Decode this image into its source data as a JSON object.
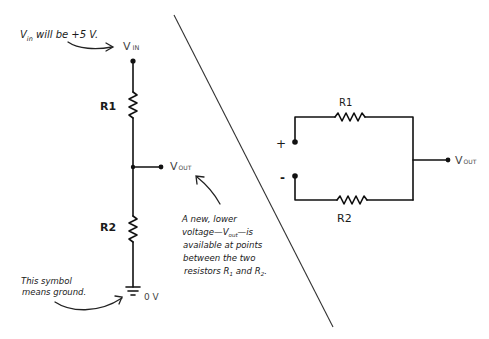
{
  "left_circuit": {
    "vin_label": "V",
    "vin_sub": "IN",
    "vin_note_v": "V",
    "vin_note_sub": "in",
    "vin_note_rest": " will be +5 V.",
    "r1_label": "R1",
    "r2_label": "R2",
    "vout_label": "V",
    "vout_sub": "OUT",
    "ground_label": "0 V",
    "ground_note": [
      "This symbol",
      "means ground."
    ],
    "vout_note": {
      "line1": "A new, lower",
      "line2_pre": "voltage—V",
      "line2_sub": "out",
      "line2_post": "—is",
      "line3": "available at points",
      "line4": "between the two",
      "line5_pre": "resistors R",
      "line5_sub1": "1",
      "line5_mid": " and R",
      "line5_sub2": "2",
      "line5_post": "."
    }
  },
  "right_circuit": {
    "r1_label": "R1",
    "r2_label": "R2",
    "plus_label": "+",
    "minus_label": "-",
    "vout_label": "V",
    "vout_sub": "OUT"
  }
}
